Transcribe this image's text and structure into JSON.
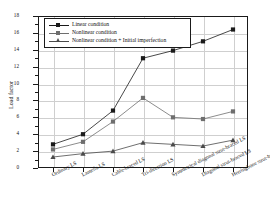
{
  "chart_data": {
    "type": "line",
    "title": "",
    "xlabel": "",
    "ylabel": "Load factor",
    "ylim": [
      0,
      18
    ],
    "yticks": [
      0,
      2,
      4,
      6,
      8,
      10,
      12,
      14,
      16,
      18
    ],
    "grid": true,
    "legend_position": "top-left",
    "categories": [
      "Ordinary LS",
      "Lamella LS",
      "Cable-braced LS",
      "Tri-direction LS",
      "Symmetrical diagonal strut-braced LS",
      "Diagonal strut-braced LS",
      "Herringbone strut-braced LS"
    ],
    "series": [
      {
        "name": "Linear condition",
        "marker": "square",
        "color": "#1a1a1a",
        "values": [
          2.8,
          4.0,
          6.8,
          13.0,
          13.9,
          15.0,
          16.4
        ]
      },
      {
        "name": "Nonlinear condition",
        "marker": "square",
        "color": "#6e6e6e",
        "values": [
          2.2,
          3.1,
          5.5,
          8.3,
          6.0,
          5.8,
          6.7
        ]
      },
      {
        "name": "Nonlinear condition + Initial imperfection",
        "marker": "triangle",
        "color": "#4a4a4a",
        "values": [
          1.3,
          1.7,
          2.0,
          3.0,
          2.8,
          2.6,
          3.3
        ]
      }
    ]
  },
  "axis": {
    "y_label": "Load factor",
    "y_tick_labels": [
      "0",
      "2",
      "4",
      "6",
      "8",
      "10",
      "12",
      "14",
      "16",
      "18"
    ]
  },
  "legend": {
    "items": [
      {
        "label": "Linear condition"
      },
      {
        "label": "Nonlinear condition"
      },
      {
        "label": "Nonlinear condition + Initial imperfection"
      }
    ]
  }
}
